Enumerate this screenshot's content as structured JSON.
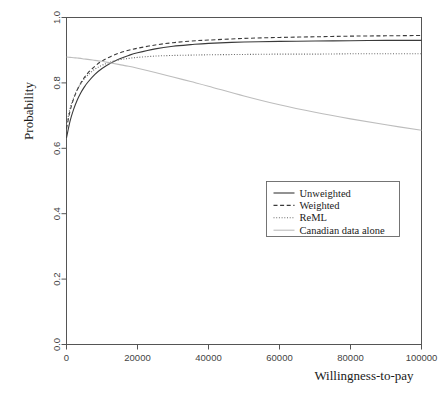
{
  "chart_data": {
    "type": "line",
    "title": "",
    "xlabel": "Willingness-to-pay",
    "ylabel": "Probability",
    "xlim": [
      0,
      100000
    ],
    "ylim": [
      0,
      1
    ],
    "grid": false,
    "legend_position": "center-right",
    "xticks": [
      0,
      20000,
      40000,
      60000,
      80000,
      100000
    ],
    "xtick_labels": [
      "0",
      "20000",
      "40000",
      "60000",
      "80000",
      "100000"
    ],
    "yticks": [
      0.0,
      0.2,
      0.4,
      0.6,
      0.8,
      1.0
    ],
    "ytick_labels": [
      "0.0",
      "0.2",
      "0.4",
      "0.6",
      "0.8",
      "1.0"
    ],
    "x": [
      0,
      1000,
      2000,
      3000,
      4000,
      5000,
      6000,
      8000,
      10000,
      12500,
      15000,
      17500,
      20000,
      25000,
      30000,
      35000,
      40000,
      50000,
      60000,
      70000,
      80000,
      90000,
      100000
    ],
    "series": [
      {
        "name": "Unweighted",
        "style": "solid",
        "color": "#3a3a3a",
        "width": 1.1,
        "values": [
          0.632,
          0.683,
          0.719,
          0.747,
          0.769,
          0.787,
          0.802,
          0.826,
          0.844,
          0.861,
          0.874,
          0.884,
          0.892,
          0.904,
          0.912,
          0.917,
          0.921,
          0.925,
          0.927,
          0.928,
          0.929,
          0.93,
          0.93
        ]
      },
      {
        "name": "Weighted",
        "style": "dashed",
        "color": "#3a3a3a",
        "width": 1.1,
        "values": [
          0.66,
          0.714,
          0.751,
          0.778,
          0.799,
          0.816,
          0.83,
          0.851,
          0.867,
          0.881,
          0.892,
          0.9,
          0.906,
          0.916,
          0.923,
          0.928,
          0.931,
          0.936,
          0.939,
          0.941,
          0.943,
          0.944,
          0.945
        ]
      },
      {
        "name": "ReML",
        "style": "dotted",
        "color": "#6a6a6a",
        "width": 1.1,
        "values": [
          0.672,
          0.722,
          0.755,
          0.779,
          0.797,
          0.812,
          0.824,
          0.842,
          0.854,
          0.864,
          0.871,
          0.875,
          0.878,
          0.882,
          0.884,
          0.885,
          0.886,
          0.887,
          0.888,
          0.888,
          0.889,
          0.889,
          0.889
        ]
      },
      {
        "name": "Canadian data alone",
        "style": "solid",
        "color": "#bdbdbd",
        "width": 1.1,
        "values": [
          0.879,
          0.878,
          0.877,
          0.876,
          0.875,
          0.873,
          0.872,
          0.869,
          0.866,
          0.861,
          0.856,
          0.851,
          0.845,
          0.832,
          0.818,
          0.804,
          0.79,
          0.76,
          0.733,
          0.71,
          0.69,
          0.672,
          0.655
        ]
      }
    ]
  },
  "legend": {
    "entries": [
      {
        "label": "Unweighted"
      },
      {
        "label": "Weighted"
      },
      {
        "label": "ReML"
      },
      {
        "label": "Canadian data alone"
      }
    ]
  }
}
